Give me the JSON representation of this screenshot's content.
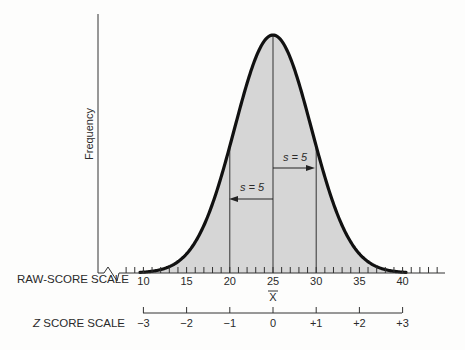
{
  "figure": {
    "y_axis_label": "Frequency",
    "raw_scale_label": "RAW-SCORE SCALE",
    "z_scale_label_italic": "Z",
    "z_scale_label_rest": " SCORE SCALE",
    "mean_symbol": "X",
    "sd_annotation_right": "s = 5",
    "sd_annotation_left": "s = 5",
    "colors": {
      "curve": "#111111",
      "fill": "#d6d6d6",
      "axis": "#333333",
      "background": "#fdfdfc"
    }
  },
  "chart_data": {
    "type": "area",
    "distribution": "normal",
    "mean": 25,
    "sd": 5,
    "xlabel": "RAW-SCORE SCALE",
    "ylabel": "Frequency",
    "raw_ticks": [
      10,
      15,
      20,
      25,
      30,
      35,
      40
    ],
    "raw_tick_labels": [
      "10",
      "15",
      "20",
      "25",
      "30",
      "35",
      "40"
    ],
    "z_ticks": [
      -3,
      -2,
      -1,
      0,
      1,
      2,
      3
    ],
    "z_tick_labels": [
      "−3",
      "−2",
      "−1",
      "0",
      "+1",
      "+2",
      "+3"
    ],
    "z_label": "Z SCORE SCALE",
    "mean_label": "X̅",
    "vertical_lines_at": [
      20,
      25,
      30
    ],
    "annotations": [
      {
        "text": "s = 5",
        "from": 25,
        "to": 30,
        "direction": "right"
      },
      {
        "text": "s = 5",
        "from": 25,
        "to": 20,
        "direction": "left"
      }
    ],
    "grid": false,
    "minor_tick_interval": 1
  }
}
